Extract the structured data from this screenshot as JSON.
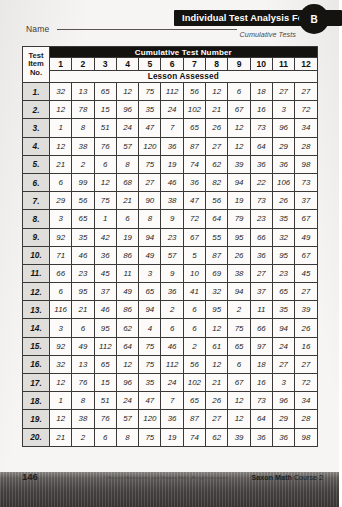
{
  "header": {
    "name_label": "Name",
    "title": "Individual Test Analysis Form",
    "form_letter": "B",
    "subtitle": "Cumulative Tests"
  },
  "table": {
    "banner": "Cumulative Test Number",
    "corner_label_line1": "Test",
    "corner_label_line2": "Item",
    "corner_label_line3": "No.",
    "lesson_row_label": "Lesson Assessed",
    "columns": [
      "1",
      "2",
      "3",
      "4",
      "5",
      "6",
      "7",
      "8",
      "9",
      "10",
      "11",
      "12"
    ],
    "row_labels": [
      "1.",
      "2.",
      "3.",
      "4.",
      "5.",
      "6.",
      "7.",
      "8.",
      "9.",
      "10.",
      "11.",
      "12.",
      "13.",
      "14.",
      "15.",
      "16.",
      "17.",
      "18.",
      "19.",
      "20."
    ],
    "rows": [
      [
        "32",
        "13",
        "65",
        "12",
        "75",
        "112",
        "56",
        "12",
        "6",
        "18",
        "27",
        "27"
      ],
      [
        "12",
        "78",
        "15",
        "96",
        "35",
        "24",
        "102",
        "21",
        "67",
        "16",
        "3",
        "72"
      ],
      [
        "1",
        "8",
        "51",
        "24",
        "47",
        "7",
        "65",
        "26",
        "12",
        "73",
        "96",
        "34"
      ],
      [
        "12",
        "38",
        "76",
        "57",
        "120",
        "36",
        "87",
        "27",
        "12",
        "64",
        "29",
        "28"
      ],
      [
        "21",
        "2",
        "6",
        "8",
        "75",
        "19",
        "74",
        "62",
        "39",
        "36",
        "36",
        "98"
      ],
      [
        "6",
        "99",
        "12",
        "68",
        "27",
        "46",
        "36",
        "82",
        "94",
        "22",
        "106",
        "73"
      ],
      [
        "29",
        "56",
        "75",
        "21",
        "90",
        "38",
        "47",
        "56",
        "19",
        "73",
        "26",
        "37"
      ],
      [
        "3",
        "65",
        "1",
        "6",
        "8",
        "9",
        "72",
        "64",
        "79",
        "23",
        "35",
        "67"
      ],
      [
        "92",
        "35",
        "42",
        "19",
        "94",
        "23",
        "67",
        "55",
        "95",
        "66",
        "32",
        "49"
      ],
      [
        "71",
        "46",
        "36",
        "86",
        "49",
        "57",
        "5",
        "87",
        "26",
        "36",
        "95",
        "67"
      ],
      [
        "66",
        "23",
        "45",
        "11",
        "3",
        "9",
        "10",
        "69",
        "38",
        "27",
        "23",
        "45"
      ],
      [
        "6",
        "95",
        "37",
        "49",
        "65",
        "36",
        "41",
        "32",
        "94",
        "37",
        "65",
        "27"
      ],
      [
        "116",
        "21",
        "46",
        "86",
        "94",
        "2",
        "6",
        "95",
        "2",
        "11",
        "35",
        "39"
      ],
      [
        "3",
        "6",
        "95",
        "62",
        "4",
        "6",
        "6",
        "12",
        "75",
        "66",
        "94",
        "26"
      ],
      [
        "92",
        "49",
        "112",
        "64",
        "75",
        "46",
        "2",
        "61",
        "65",
        "97",
        "24",
        "16"
      ],
      [
        "32",
        "13",
        "65",
        "12",
        "75",
        "112",
        "56",
        "12",
        "6",
        "18",
        "27",
        "27"
      ],
      [
        "12",
        "76",
        "15",
        "96",
        "35",
        "24",
        "102",
        "21",
        "67",
        "16",
        "3",
        "72"
      ],
      [
        "1",
        "8",
        "51",
        "24",
        "47",
        "7",
        "65",
        "26",
        "12",
        "73",
        "96",
        "34"
      ],
      [
        "12",
        "38",
        "76",
        "57",
        "120",
        "36",
        "87",
        "27",
        "12",
        "64",
        "29",
        "28"
      ],
      [
        "21",
        "2",
        "6",
        "8",
        "75",
        "19",
        "74",
        "62",
        "39",
        "36",
        "36",
        "98"
      ]
    ]
  },
  "footer": {
    "page_number": "146",
    "copyright": "© Harcourt Achieve Inc. and Stephen Hake. All rights reserved.",
    "book_title": "Saxon Math",
    "book_course": "Course 2"
  }
}
